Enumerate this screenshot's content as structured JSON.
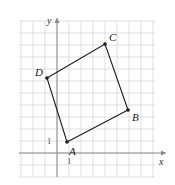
{
  "figure": {
    "kind": "coordinate-grid-quadrilateral",
    "background_color": "#ffffff",
    "grid": {
      "visible": true,
      "color": "#c9c9d6",
      "spacing_px": 12,
      "x_range_px": [
        19,
        155
      ],
      "y_range_px": [
        21,
        177
      ]
    },
    "axes": {
      "x_axis": {
        "label": "x",
        "color": "#8a8a8a",
        "y_px": 153,
        "from_px": 19,
        "to_px": 166,
        "arrow": true,
        "tick_label": "1",
        "tick_label_value": 1
      },
      "y_axis": {
        "label": "y",
        "color": "#8a8a8a",
        "x_px": 57,
        "from_px": 177,
        "to_px": 18,
        "arrow": true,
        "tick_label": "1",
        "tick_label_value": 1
      },
      "origin_px": [
        57,
        153
      ]
    },
    "shape": {
      "name": "quadrilateral-abcd",
      "stroke_color": "#1a1a1a",
      "stroke_width": 1.1,
      "fill": "none",
      "closed": true,
      "edges": [
        "A-B",
        "B-C",
        "C-D",
        "D-A"
      ],
      "vertices": [
        {
          "label": "A",
          "x_px": 67,
          "y_px": 142,
          "grid_x": 1,
          "grid_y": 1,
          "label_dx": 2,
          "label_dy": 4
        },
        {
          "label": "B",
          "x_px": 128,
          "y_px": 110,
          "grid_x": 6,
          "grid_y": 4,
          "label_dx": 4,
          "label_dy": 2
        },
        {
          "label": "C",
          "x_px": 105,
          "y_px": 44,
          "grid_x": 4,
          "grid_y": 9,
          "label_dx": 4,
          "label_dy": -12
        },
        {
          "label": "D",
          "x_px": 47,
          "y_px": 78,
          "grid_x": -1,
          "grid_y": 6,
          "label_dx": -12,
          "label_dy": -11
        }
      ],
      "vertex_dot_color": "#1a1a1a",
      "vertex_dot_radius": 1.8
    }
  }
}
